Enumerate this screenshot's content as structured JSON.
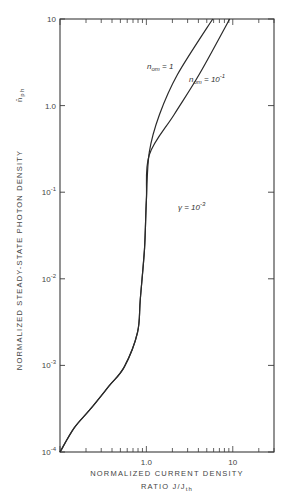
{
  "chart_data": {
    "type": "line",
    "title": "",
    "xlabel": "NORMALIZED CURRENT DENSITY RATIO J/J_th",
    "xlabel_line1": "NORMALIZED CURRENT DENSITY",
    "xlabel_line2": "RATIO  J/J",
    "xlabel_sub": "th",
    "ylabel": "NORMALIZED STEADY-STATE PHOTON DENSITY  n̄_ph",
    "ylabel_main": "NORMALIZED STEADY-STATE PHOTON DENSITY",
    "ylabel_symbol": "n̄",
    "ylabel_sub": "ph",
    "xscale": "log",
    "yscale": "log",
    "xlim": [
      0.1,
      30
    ],
    "ylim": [
      0.0001,
      10
    ],
    "grid": false,
    "x_ticks": [
      {
        "value": 1.0,
        "label": "1.0"
      },
      {
        "value": 10,
        "label": "10"
      }
    ],
    "y_ticks": [
      {
        "value": 10,
        "label": "10"
      },
      {
        "value": 1.0,
        "label": "1.0"
      },
      {
        "value": 0.1,
        "label": "10",
        "exp": "-1"
      },
      {
        "value": 0.01,
        "label": "10",
        "exp": "-2"
      },
      {
        "value": 0.001,
        "label": "10",
        "exp": "-3"
      },
      {
        "value": 0.0001,
        "label": "10",
        "exp": "-4"
      }
    ],
    "series": [
      {
        "name": "n_om = 1",
        "label_main": "n",
        "label_sub": "om",
        "label_rest": " = 1",
        "x": [
          0.1,
          0.146,
          0.223,
          0.37,
          0.555,
          0.79,
          0.85,
          0.95,
          1.0,
          1.08,
          1.42,
          2.3,
          5.85
        ],
        "y": [
          0.0001,
          0.00019,
          0.00031,
          0.00058,
          0.00096,
          0.0024,
          0.0058,
          0.022,
          0.082,
          0.29,
          0.79,
          2.3,
          10
        ]
      },
      {
        "name": "n_om = 10^-1",
        "label_main": "n",
        "label_sub": "om",
        "label_rest": " = 10",
        "label_exp": "-1",
        "x": [
          0.1,
          0.146,
          0.223,
          0.37,
          0.555,
          0.79,
          0.85,
          0.95,
          1.0,
          1.08,
          2.1,
          4.1,
          9.2
        ],
        "y": [
          0.0001,
          0.00019,
          0.00031,
          0.00058,
          0.00096,
          0.0024,
          0.0058,
          0.022,
          0.082,
          0.27,
          0.79,
          2.3,
          10
        ]
      }
    ],
    "annotations": [
      {
        "text": "γ = 10",
        "exp": "-3",
        "x": 2.5,
        "y": 0.055
      }
    ]
  }
}
